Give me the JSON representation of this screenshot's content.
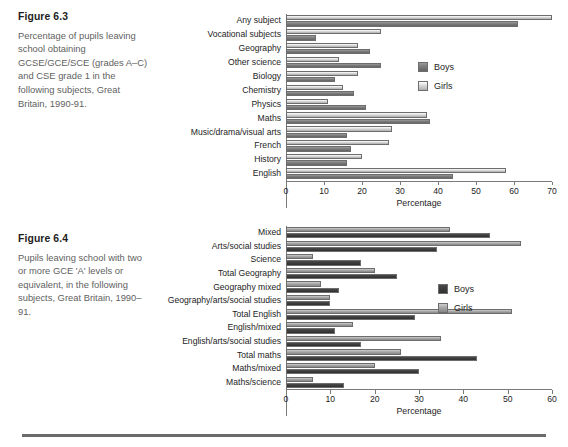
{
  "page": {
    "bottom_rule": true
  },
  "figures": [
    {
      "id": "fig63",
      "title": "Figure 6.3",
      "description": "Percentage of pupils leaving school obtaining GCSE/GCE/SCE (grades A–C) and CSE grade 1 in the following subjects, Great Britain, 1990-91.",
      "legend": [
        {
          "label": "Boys",
          "color": "#7d7d7d"
        },
        {
          "label": "Girls",
          "color": "#d9d9d9"
        }
      ],
      "chart_data": {
        "type": "bar",
        "orientation": "horizontal",
        "title": "",
        "xlabel": "Percentage",
        "ylabel": "",
        "xlim": [
          0,
          70
        ],
        "xticks": [
          0,
          10,
          20,
          30,
          40,
          50,
          60,
          70
        ],
        "grid": false,
        "legend_position": "inside-right",
        "categories": [
          "Any subject",
          "Vocational subjects",
          "Geography",
          "Other science",
          "Biology",
          "Chemistry",
          "Physics",
          "Maths",
          "Music/drama/visual arts",
          "French",
          "History",
          "English"
        ],
        "series": [
          {
            "name": "Boys",
            "color": "#7d7d7d",
            "values": [
              61,
              8,
              22,
              25,
              13,
              15,
              18,
              21,
              38,
              16,
              17,
              16,
              44
            ]
          },
          {
            "name": "Girls",
            "color": "#d9d9d9",
            "values": [
              70,
              25,
              19,
              14,
              19,
              15,
              11,
              37,
              28,
              27,
              20,
              58
            ]
          }
        ],
        "data": [
          {
            "category": "Any subject",
            "boys": 61,
            "girls": 70
          },
          {
            "category": "Vocational subjects",
            "boys": 8,
            "girls": 25
          },
          {
            "category": "Geography",
            "boys": 22,
            "girls": 19
          },
          {
            "category": "Other science",
            "boys": 25,
            "girls": 14
          },
          {
            "category": "Biology",
            "boys": 13,
            "girls": 19
          },
          {
            "category": "Chemistry",
            "boys": 18,
            "girls": 15
          },
          {
            "category": "Physics",
            "boys": 21,
            "girls": 11
          },
          {
            "category": "Maths",
            "boys": 38,
            "girls": 37
          },
          {
            "category": "Music/drama/visual arts",
            "boys": 16,
            "girls": 28
          },
          {
            "category": "French",
            "boys": 17,
            "girls": 27
          },
          {
            "category": "History",
            "boys": 16,
            "girls": 20
          },
          {
            "category": "English",
            "boys": 44,
            "girls": 58
          }
        ]
      }
    },
    {
      "id": "fig64",
      "title": "Figure 6.4",
      "description": "Pupils leaving school with two or more GCE 'A' levels or equivalent, in the following subjects, Great Britain, 1990–91.",
      "legend": [
        {
          "label": "Boys",
          "color": "#3d3d3d"
        },
        {
          "label": "Girls",
          "color": "#a8a8a8"
        }
      ],
      "chart_data": {
        "type": "bar",
        "orientation": "horizontal",
        "title": "",
        "xlabel": "Percentage",
        "ylabel": "",
        "xlim": [
          0,
          60
        ],
        "xticks": [
          0,
          10,
          20,
          30,
          40,
          50,
          60
        ],
        "grid": false,
        "legend_position": "inside-right",
        "categories": [
          "Mixed",
          "Arts/social studies",
          "Science",
          "Total Geography",
          "Geography mixed",
          "Geography/arts/social studies",
          "Total English",
          "English/mixed",
          "English/arts/social studies",
          "Total maths",
          "Maths/mixed",
          "Maths/science"
        ],
        "series": [
          {
            "name": "Boys",
            "color": "#3d3d3d",
            "values": [
              46,
              34,
              17,
              25,
              12,
              10,
              29,
              11,
              17,
              43,
              30,
              13
            ]
          },
          {
            "name": "Girls",
            "color": "#a8a8a8",
            "values": [
              37,
              53,
              6,
              20,
              8,
              10,
              51,
              15,
              35,
              26,
              20,
              6
            ]
          }
        ],
        "data": [
          {
            "category": "Mixed",
            "boys": 46,
            "girls": 37
          },
          {
            "category": "Arts/social studies",
            "boys": 34,
            "girls": 53
          },
          {
            "category": "Science",
            "boys": 17,
            "girls": 6
          },
          {
            "category": "Total Geography",
            "boys": 25,
            "girls": 20
          },
          {
            "category": "Geography mixed",
            "boys": 12,
            "girls": 8
          },
          {
            "category": "Geography/arts/social studies",
            "boys": 10,
            "girls": 10
          },
          {
            "category": "Total English",
            "boys": 29,
            "girls": 51
          },
          {
            "category": "English/mixed",
            "boys": 11,
            "girls": 15
          },
          {
            "category": "English/arts/social studies",
            "boys": 17,
            "girls": 35
          },
          {
            "category": "Total maths",
            "boys": 43,
            "girls": 26
          },
          {
            "category": "Maths/mixed",
            "boys": 30,
            "girls": 20
          },
          {
            "category": "Maths/science",
            "boys": 13,
            "girls": 6
          }
        ]
      }
    }
  ]
}
